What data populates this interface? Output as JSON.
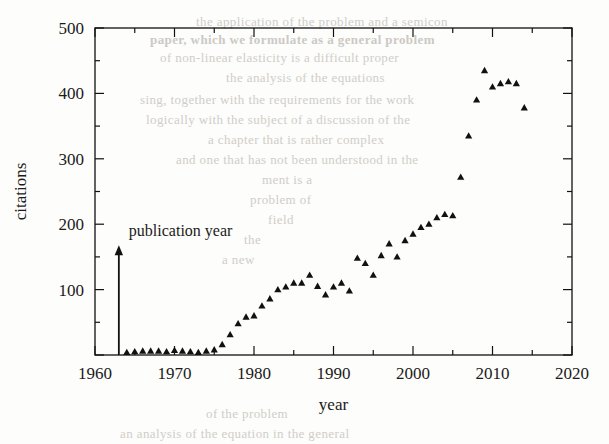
{
  "figure": {
    "background_color": "#fdfdfb",
    "ink_color": "#1a1a1a",
    "bleed_color": "#c9c6c0"
  },
  "annotation": {
    "publication_year_label": "publication year",
    "publication_year_value": 1963
  },
  "bleedthrough": {
    "note": "faint show-through text from reverse page",
    "lines": [
      {
        "text": "the application of the problem and a semicon",
        "x": 196,
        "y": 14,
        "bold": false
      },
      {
        "text": "paper, which we formulate as a general problem",
        "x": 150,
        "y": 32,
        "bold": true
      },
      {
        "text": "of non-linear elasticity is a difficult proper",
        "x": 160,
        "y": 50,
        "bold": false
      },
      {
        "text": "the analysis of the equations",
        "x": 226,
        "y": 70,
        "bold": false
      },
      {
        "text": "sing, together with the requirements for the work",
        "x": 140,
        "y": 92,
        "bold": false
      },
      {
        "text": "logically with the subject of a discussion of the",
        "x": 146,
        "y": 112,
        "bold": false
      },
      {
        "text": "a chapter that is rather complex",
        "x": 208,
        "y": 132,
        "bold": false
      },
      {
        "text": "and one that has not been understood in the",
        "x": 176,
        "y": 152,
        "bold": false
      },
      {
        "text": "ment is a",
        "x": 262,
        "y": 172,
        "bold": false
      },
      {
        "text": "problem of",
        "x": 250,
        "y": 192,
        "bold": false
      },
      {
        "text": "field",
        "x": 268,
        "y": 212,
        "bold": false
      },
      {
        "text": "the",
        "x": 244,
        "y": 232,
        "bold": false
      },
      {
        "text": "a new",
        "x": 222,
        "y": 252,
        "bold": false
      },
      {
        "text": "of the problem",
        "x": 206,
        "y": 406,
        "bold": false
      },
      {
        "text": "an analysis of the equation in the general",
        "x": 120,
        "y": 426,
        "bold": false
      }
    ]
  },
  "chart_data": {
    "type": "scatter",
    "title": "",
    "xlabel": "year",
    "ylabel": "citations",
    "xlim": [
      1960,
      2020
    ],
    "ylim": [
      0,
      500
    ],
    "xticks": [
      1960,
      1970,
      1980,
      1990,
      2000,
      2010,
      2020
    ],
    "xticklabels": [
      "1960",
      "1970",
      "1980",
      "1990",
      "2000",
      "2010",
      "2020"
    ],
    "xminor_step": 5,
    "yticks": [
      0,
      100,
      200,
      300,
      400,
      500
    ],
    "yticklabels": [
      "",
      "100",
      "200",
      "300",
      "400",
      "500"
    ],
    "yminor_step": 50,
    "grid": false,
    "legend": null,
    "marker": "triangle-up",
    "marker_color": "#111111",
    "marker_size": 6,
    "x": [
      1964,
      1965,
      1966,
      1967,
      1968,
      1969,
      1970,
      1971,
      1972,
      1973,
      1974,
      1975,
      1976,
      1977,
      1978,
      1979,
      1980,
      1981,
      1982,
      1983,
      1984,
      1985,
      1986,
      1987,
      1988,
      1989,
      1990,
      1991,
      1992,
      1993,
      1994,
      1995,
      1996,
      1997,
      1998,
      1999,
      2000,
      2001,
      2002,
      2003,
      2004,
      2005,
      2006,
      2007,
      2008,
      2009,
      2010,
      2011,
      2012,
      2013,
      2014
    ],
    "y": [
      4,
      5,
      6,
      6,
      6,
      5,
      7,
      6,
      5,
      4,
      6,
      8,
      16,
      31,
      48,
      58,
      60,
      75,
      86,
      100,
      104,
      110,
      110,
      122,
      105,
      92,
      104,
      110,
      98,
      148,
      140,
      122,
      152,
      170,
      150,
      175,
      185,
      195,
      200,
      210,
      215,
      213,
      272,
      335,
      390,
      435,
      410,
      415,
      418,
      415,
      378
    ]
  }
}
